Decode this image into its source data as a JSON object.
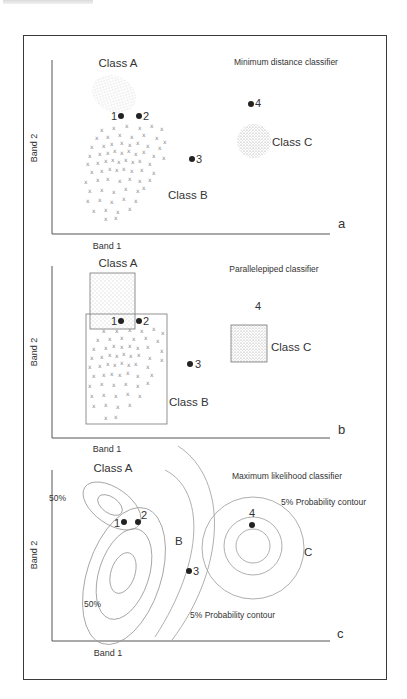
{
  "figure": {
    "panels": [
      {
        "id": "a",
        "panel_letter": "a",
        "title": "Minimum distance classifier",
        "x_axis_label": "Band 1",
        "y_axis_label": "Band 2",
        "class_labels": {
          "A": "Class  A",
          "B": "Class  B",
          "C": "Class  C"
        },
        "points": [
          {
            "label": "1",
            "x": 120,
            "y": 116
          },
          {
            "label": "2",
            "x": 139,
            "y": 116
          },
          {
            "label": "3",
            "x": 191,
            "y": 159
          },
          {
            "label": "4",
            "x": 250,
            "y": 103
          }
        ]
      },
      {
        "id": "b",
        "panel_letter": "b",
        "title": "Parallelepiped classifier",
        "x_axis_label": "Band 1",
        "y_axis_label": "Band 2",
        "class_labels": {
          "A": "Class  A",
          "B": "Class  B",
          "C": "Class  C"
        },
        "points": [
          {
            "label": "1",
            "x": 120,
            "y": 321
          },
          {
            "label": "2",
            "x": 139,
            "y": 321
          },
          {
            "label": "3",
            "x": 190,
            "y": 364
          },
          {
            "label": "4",
            "x": 260,
            "y": 306
          }
        ]
      },
      {
        "id": "c",
        "panel_letter": "c",
        "title": "Maximum likelihood classifier",
        "x_axis_label": "Band 1",
        "y_axis_label": "Band 2",
        "class_labels": {
          "A": "Class  A",
          "B": "B",
          "C": "C"
        },
        "contour_labels": {
          "a_upper": "50%",
          "a_lower": "50%",
          "c_outer": "5% Probability contour",
          "b_outer": "5% Probability contour"
        },
        "points": [
          {
            "label": "1",
            "x": 124,
            "y": 522
          },
          {
            "label": "2",
            "x": 138,
            "y": 522
          },
          {
            "label": "3",
            "x": 189,
            "y": 571
          },
          {
            "label": "4",
            "x": 252,
            "y": 525
          }
        ]
      }
    ]
  }
}
